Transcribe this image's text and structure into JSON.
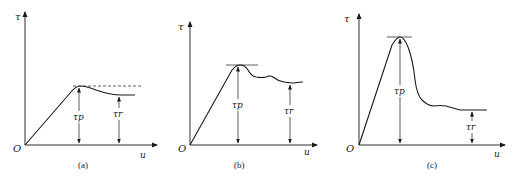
{
  "figure": {
    "panels": [
      {
        "id": "a",
        "caption": "(a)",
        "y_axis_label": "τ",
        "x_axis_label": "u",
        "origin_label": "O",
        "peak_label": "τp",
        "residual_label": "τr",
        "peak_reference_line": "dashed",
        "description": "Linear rise to a rounded peak, gentle drop to a residual plateau slightly below peak"
      },
      {
        "id": "b",
        "caption": "(b)",
        "y_axis_label": "τ",
        "x_axis_label": "u",
        "origin_label": "O",
        "peak_label": "τp",
        "residual_label": "τr",
        "peak_reference_line": "solid tangent",
        "description": "Linear rise to a sharper peak, then wavy softening to a residual level moderately below peak"
      },
      {
        "id": "c",
        "caption": "(c)",
        "y_axis_label": "τ",
        "x_axis_label": "u",
        "origin_label": "O",
        "peak_label": "τp",
        "residual_label": "τr",
        "peak_reference_line": "solid tangent",
        "description": "Steep rise to a high peak, sharp brittle drop to a low residual plateau"
      }
    ],
    "colors": {
      "line": "#1a1a1a",
      "background": "#ffffff"
    }
  }
}
